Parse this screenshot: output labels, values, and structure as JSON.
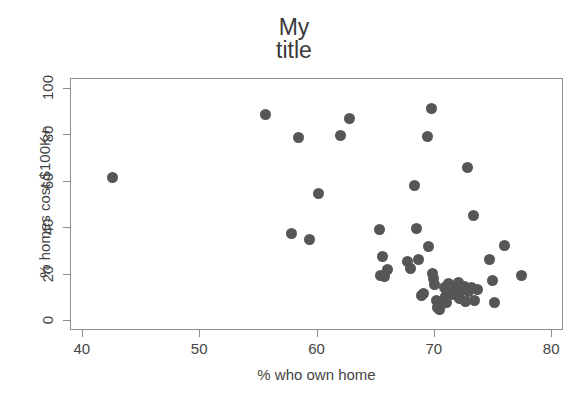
{
  "chart_data": {
    "type": "scatter",
    "title": "My\ntitle",
    "title_line1": "My",
    "title_line2": "title",
    "xlabel": "% who own home",
    "ylabel": "% homes cost $100K+",
    "xlim": [
      40,
      80
    ],
    "ylim": [
      0,
      100
    ],
    "xticks": [
      40,
      50,
      60,
      70,
      80
    ],
    "yticks": [
      0,
      20,
      40,
      60,
      80,
      100
    ],
    "grid": false,
    "legend": null,
    "marker_color": "#565656",
    "marker_size": 11,
    "frame_color": "#8d8d8d",
    "background": "#ffffff",
    "points": [
      {
        "x": 42.5,
        "y": 62.0
      },
      {
        "x": 55.6,
        "y": 89.0
      },
      {
        "x": 57.8,
        "y": 37.5
      },
      {
        "x": 58.4,
        "y": 79.0
      },
      {
        "x": 59.3,
        "y": 35.0
      },
      {
        "x": 60.1,
        "y": 55.0
      },
      {
        "x": 62.0,
        "y": 80.0
      },
      {
        "x": 62.7,
        "y": 87.5
      },
      {
        "x": 65.3,
        "y": 39.5
      },
      {
        "x": 65.5,
        "y": 28.0
      },
      {
        "x": 65.4,
        "y": 19.5
      },
      {
        "x": 65.7,
        "y": 19.0
      },
      {
        "x": 66.0,
        "y": 22.0
      },
      {
        "x": 67.7,
        "y": 25.5
      },
      {
        "x": 67.9,
        "y": 22.5
      },
      {
        "x": 68.3,
        "y": 58.5
      },
      {
        "x": 68.4,
        "y": 40.0
      },
      {
        "x": 68.6,
        "y": 26.5
      },
      {
        "x": 69.0,
        "y": 12.0
      },
      {
        "x": 68.9,
        "y": 11.0
      },
      {
        "x": 69.4,
        "y": 79.5
      },
      {
        "x": 69.7,
        "y": 91.5
      },
      {
        "x": 69.5,
        "y": 32.0
      },
      {
        "x": 69.8,
        "y": 20.5
      },
      {
        "x": 69.9,
        "y": 18.5
      },
      {
        "x": 70.0,
        "y": 15.5
      },
      {
        "x": 70.1,
        "y": 9.0
      },
      {
        "x": 70.2,
        "y": 6.0
      },
      {
        "x": 70.4,
        "y": 5.0
      },
      {
        "x": 70.6,
        "y": 7.0
      },
      {
        "x": 70.8,
        "y": 14.5
      },
      {
        "x": 70.9,
        "y": 10.5
      },
      {
        "x": 71.0,
        "y": 8.0
      },
      {
        "x": 71.2,
        "y": 16.0
      },
      {
        "x": 71.3,
        "y": 13.5
      },
      {
        "x": 71.5,
        "y": 15.0
      },
      {
        "x": 71.6,
        "y": 11.5
      },
      {
        "x": 71.8,
        "y": 14.0
      },
      {
        "x": 72.0,
        "y": 16.5
      },
      {
        "x": 72.1,
        "y": 9.5
      },
      {
        "x": 72.3,
        "y": 13.0
      },
      {
        "x": 72.5,
        "y": 15.0
      },
      {
        "x": 72.6,
        "y": 8.5
      },
      {
        "x": 72.8,
        "y": 66.0
      },
      {
        "x": 72.9,
        "y": 12.5
      },
      {
        "x": 73.1,
        "y": 14.5
      },
      {
        "x": 73.3,
        "y": 45.5
      },
      {
        "x": 73.4,
        "y": 9.0
      },
      {
        "x": 73.6,
        "y": 13.5
      },
      {
        "x": 74.7,
        "y": 26.5
      },
      {
        "x": 74.9,
        "y": 17.5
      },
      {
        "x": 75.1,
        "y": 8.0
      },
      {
        "x": 75.9,
        "y": 32.5
      },
      {
        "x": 77.4,
        "y": 19.5
      }
    ]
  }
}
